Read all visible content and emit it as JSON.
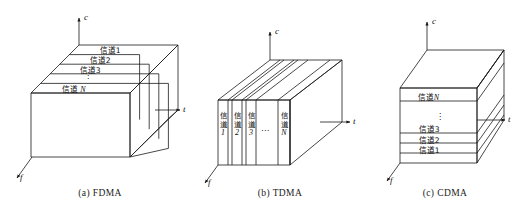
{
  "figure": {
    "title_visible": false,
    "background": "#ffffff",
    "line_color": "#1a1a1a",
    "panels": [
      {
        "id": "fdma",
        "caption": "(a)  FDMA",
        "axes": {
          "vertical": "c",
          "horizontal": "t",
          "depth": "f"
        },
        "orientation": "channels-sliced-along-depth (top face strips)",
        "channels": [
          "信道1",
          "信道2",
          "信道3",
          "⋮",
          "信道N"
        ]
      },
      {
        "id": "tdma",
        "caption": "(b)  TDMA",
        "axes": {
          "vertical": "c",
          "horizontal": "t",
          "depth": "f"
        },
        "orientation": "channels-sliced-along-time (vertical front slabs)",
        "channels": [
          "信道1",
          "信道2",
          "信道3",
          "⋯",
          "信道N"
        ],
        "vertical_text": [
          "信",
          "道"
        ]
      },
      {
        "id": "cdma",
        "caption": "(c)  CDMA",
        "axes": {
          "vertical": "c",
          "horizontal": "t",
          "depth": "f"
        },
        "orientation": "channels-stacked-along-code (horizontal front layers)",
        "channels": [
          "信道N",
          "⋮",
          "信道3",
          "信道2",
          "信道1"
        ]
      }
    ]
  }
}
